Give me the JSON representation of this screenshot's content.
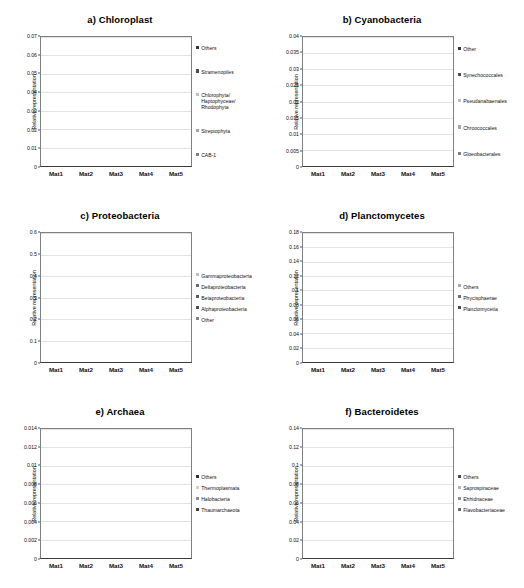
{
  "figure": {
    "mats": [
      "Mat1",
      "Mat2",
      "Mat3",
      "Mat4",
      "Mat5"
    ],
    "ylabel": "Relative representation"
  },
  "chart_data": [
    {
      "type": "bar",
      "stacked": true,
      "panel": "a",
      "title": "a) Chloroplast",
      "categories": [
        "Mat1",
        "Mat2",
        "Mat3",
        "Mat4",
        "Mat5"
      ],
      "xlabel": "",
      "ylabel": "Relative representation",
      "ylim": [
        0,
        0.07
      ],
      "yticks": [
        "0",
        "0.01",
        "0.02",
        "0.03",
        "0.04",
        "0.05",
        "0.06",
        "0.07"
      ],
      "ytick_values": [
        0,
        0.01,
        0.02,
        0.03,
        0.04,
        0.05,
        0.06,
        0.07
      ],
      "grid": true,
      "legend_position": "right",
      "series": [
        {
          "name": "CAB-1",
          "color": "#808080",
          "values": [
            0.0585,
            0.0225,
            0.0415,
            0.026,
            0.0255
          ]
        },
        {
          "name": "Streptophyta",
          "color": "#a6a6a6",
          "values": [
            0.0,
            0.0,
            0.0,
            0.0,
            0.0
          ]
        },
        {
          "name": "Chlorophyta/\nHaptophyceae/\nRhodophyta",
          "color": "#bfbfbf",
          "values": [
            0.0,
            0.0,
            0.0,
            0.0,
            0.0
          ]
        },
        {
          "name": "Stramenopiles",
          "color": "#4d4d4d",
          "values": [
            0.0,
            0.0,
            0.0,
            0.0,
            0.0
          ]
        },
        {
          "name": "Others",
          "color": "#333333",
          "values": [
            0.001,
            0.004,
            0.007,
            0.0375,
            0.033
          ]
        }
      ]
    },
    {
      "type": "bar",
      "stacked": true,
      "panel": "b",
      "title": "b) Cyanobacteria",
      "categories": [
        "Mat1",
        "Mat2",
        "Mat3",
        "Mat4",
        "Mat5"
      ],
      "xlabel": "",
      "ylabel": "Relative representation",
      "ylim": [
        0,
        0.04
      ],
      "yticks": [
        "0",
        "0.005",
        "0.01",
        "0.015",
        "0.02",
        "0.025",
        "0.03",
        "0.035",
        "0.04"
      ],
      "ytick_values": [
        0,
        0.005,
        0.01,
        0.015,
        0.02,
        0.025,
        0.03,
        0.035,
        0.04
      ],
      "grid": true,
      "legend_position": "right",
      "series": [
        {
          "name": "Gloeobacterales",
          "color": "#808080",
          "values": [
            0.0041,
            0.0032,
            0.0021,
            0.0135,
            0.0289
          ]
        },
        {
          "name": "Chroococcales",
          "color": "#a6a6a6",
          "values": [
            0.0,
            0.0,
            0.0,
            0.0,
            0.0
          ]
        },
        {
          "name": "Pseudanabaenales",
          "color": "#bfbfbf",
          "values": [
            0.0,
            0.0,
            0.0,
            0.0,
            0.0
          ]
        },
        {
          "name": "Synechococcales",
          "color": "#4d4d4d",
          "values": [
            0.0,
            0.0,
            0.0,
            0.0,
            0.0
          ]
        },
        {
          "name": "Other",
          "color": "#333333",
          "values": [
            0.0008,
            0.0003,
            0.0,
            0.0042,
            0.0031
          ]
        }
      ]
    },
    {
      "type": "bar",
      "stacked": true,
      "panel": "c",
      "title": "c) Proteobacteria",
      "categories": [
        "Mat1",
        "Mat2",
        "Mat3",
        "Mat4",
        "Mat5"
      ],
      "xlabel": "",
      "ylabel": "Relative representation",
      "ylim": [
        0,
        0.6
      ],
      "yticks": [
        "0",
        "0.1",
        "0.2",
        "0.3",
        "0.4",
        "0.5",
        "0.6"
      ],
      "ytick_values": [
        0,
        0.1,
        0.2,
        0.3,
        0.4,
        0.5,
        0.6
      ],
      "grid": true,
      "legend_position": "right",
      "series": [
        {
          "name": "Other",
          "color": "#808080",
          "values": [
            0.14,
            0.16,
            0.145,
            0.1,
            0.105
          ]
        },
        {
          "name": "Alphaproteobacteria",
          "color": "#4d4d4d",
          "values": [
            0.08,
            0.075,
            0.105,
            0.135,
            0.125
          ]
        },
        {
          "name": "Betaproteobacteria",
          "color": "#5c5c5c",
          "values": [
            0.0,
            0.0,
            0.0,
            0.0,
            0.0
          ]
        },
        {
          "name": "Deltaproteobacteria",
          "color": "#6b6b6b",
          "values": [
            0.0,
            0.0,
            0.0,
            0.0,
            0.0
          ]
        },
        {
          "name": "Gammaproteobacteria",
          "color": "#c0c0c0",
          "values": [
            0.28,
            0.285,
            0.295,
            0.205,
            0.205
          ]
        }
      ]
    },
    {
      "type": "bar",
      "stacked": true,
      "panel": "d",
      "title": "d) Planctomycetes",
      "categories": [
        "Mat1",
        "Mat2",
        "Mat3",
        "Mat4",
        "Mat5"
      ],
      "xlabel": "",
      "ylabel": "Relative representation",
      "ylim": [
        0,
        0.18
      ],
      "yticks": [
        "0",
        "0.02",
        "0.04",
        "0.06",
        "0.08",
        "0.1",
        "0.12",
        "0.14",
        "0.16",
        "0.18"
      ],
      "ytick_values": [
        0,
        0.02,
        0.04,
        0.06,
        0.08,
        0.1,
        0.12,
        0.14,
        0.16,
        0.18
      ],
      "grid": true,
      "legend_position": "right",
      "series": [
        {
          "name": "Planctomycetia",
          "color": "#4a4a4a",
          "values": [
            0.06,
            0.064,
            0.055,
            0.145,
            0.148
          ]
        },
        {
          "name": "Phycisphaerae",
          "color": "#6e6e6e",
          "values": [
            0.0,
            0.0,
            0.0,
            0.0,
            0.0
          ]
        },
        {
          "name": "Others",
          "color": "#a8a8a8",
          "values": [
            0.01,
            0.015,
            0.014,
            0.02,
            0.02
          ]
        }
      ]
    },
    {
      "type": "bar",
      "stacked": true,
      "panel": "e",
      "title": "e) Archaea",
      "categories": [
        "Mat1",
        "Mat2",
        "Mat3",
        "Mat4",
        "Mat5"
      ],
      "xlabel": "",
      "ylabel": "Relative representation",
      "ylim": [
        0,
        0.014
      ],
      "yticks": [
        "0",
        "0.002",
        "0.004",
        "0.006",
        "0.008",
        "0.01",
        "0.012",
        "0.014"
      ],
      "ytick_values": [
        0,
        0.002,
        0.004,
        0.006,
        0.008,
        0.01,
        0.012,
        0.014
      ],
      "grid": true,
      "legend_position": "right",
      "series": [
        {
          "name": "Thaumarchaeota",
          "color": "#3f3f3f",
          "values": [
            0.0003,
            0.00025,
            0.0008,
            0.009,
            0.0089
          ]
        },
        {
          "name": "Halobacteria",
          "color": "#8c8c8c",
          "values": [
            0.0001,
            0.0002,
            0.0001,
            0.0,
            0.0
          ]
        },
        {
          "name": "Thermoplasmata",
          "color": "#d0d0d0",
          "values": [
            0.0,
            0.0,
            0.0,
            0.0,
            0.0
          ]
        },
        {
          "name": "Others",
          "color": "#2e2e2e",
          "values": [
            0.0046,
            0.00365,
            0.0029,
            0.0023,
            0.00265
          ]
        }
      ]
    },
    {
      "type": "bar",
      "stacked": true,
      "panel": "f",
      "title": "f) Bacteroidetes",
      "categories": [
        "Mat1",
        "Mat2",
        "Mat3",
        "Mat4",
        "Mat5"
      ],
      "xlabel": "",
      "ylabel": "Relative representation",
      "ylim": [
        0,
        0.14
      ],
      "yticks": [
        "0",
        "0.02",
        "0.04",
        "0.06",
        "0.08",
        "0.1",
        "0.12",
        "0.14"
      ],
      "ytick_values": [
        0,
        0.02,
        0.04,
        0.06,
        0.08,
        0.1,
        0.12,
        0.14
      ],
      "grid": true,
      "legend_position": "right",
      "series": [
        {
          "name": "Flavobacteriaceae",
          "color": "#6b6b6b",
          "values": [
            0.042,
            0.041,
            0.035,
            0.022,
            0.024
          ]
        },
        {
          "name": "Ehhidnaceae",
          "color": "#8f8f8f",
          "values": [
            0.0,
            0.0,
            0.0,
            0.0,
            0.0
          ]
        },
        {
          "name": "Saprospiraceae",
          "color": "#b5b5b5",
          "values": [
            0.036,
            0.03,
            0.018,
            0.023,
            0.022
          ]
        },
        {
          "name": "Others",
          "color": "#474747",
          "values": [
            0.039,
            0.04,
            0.032,
            0.035,
            0.034
          ]
        }
      ]
    }
  ]
}
